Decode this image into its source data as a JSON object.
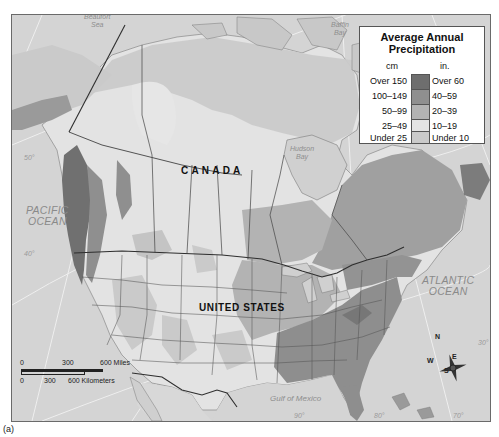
{
  "figure": {
    "caption": "(a)"
  },
  "legend": {
    "title": "Average Annual Precipitation",
    "title_line1": "Average Annual",
    "title_line2": "Precipitation",
    "unit_cm": "cm",
    "unit_in": "in.",
    "items": [
      {
        "cm": "Over 150",
        "in": "Over 60",
        "color": "#6e6e6e"
      },
      {
        "cm": "100–149",
        "in": "40–59",
        "color": "#8f8f8f"
      },
      {
        "cm": "50–99",
        "in": "20–39",
        "color": "#b3b3b3"
      },
      {
        "cm": "25–49",
        "in": "10–19",
        "color": "#e4e4e4"
      },
      {
        "cm": "Under 25",
        "in": "Under 10",
        "color": "#cacaca"
      }
    ]
  },
  "labels": {
    "countries": {
      "canada": "CANADA",
      "united_states": "UNITED STATES"
    },
    "oceans": {
      "pacific_line1": "PACIFIC",
      "pacific_line2": "OCEAN",
      "atlantic_line1": "ATLANTIC",
      "atlantic_line2": "OCEAN"
    },
    "water_bodies": {
      "beaufort_line1": "Beaufort",
      "beaufort_line2": "Sea",
      "baffin_line1": "Baffin",
      "baffin_line2": "Bay",
      "hudson_line1": "Hudson",
      "hudson_line2": "Bay",
      "gulf": "Gulf of Mexico"
    },
    "graticule": {
      "lat_50_west": "50°",
      "lat_40_west": "40°",
      "lat_30_east": "30°",
      "lon_90": "90°",
      "lon_80": "80°",
      "lon_70": "70°"
    }
  },
  "scale_bar": {
    "miles": {
      "start": "0",
      "mid": "300",
      "end": "600 Miles"
    },
    "kilometers": {
      "start": "0",
      "mid": "300",
      "end": "600 Kilometers"
    }
  },
  "compass": {
    "n": "N",
    "s": "S",
    "e": "E",
    "w": "W"
  },
  "colors": {
    "ocean": "#d4d4d4",
    "frame": "#6a6a6a",
    "border": "#3a3a3a",
    "graticule": "#f4f4f4"
  }
}
